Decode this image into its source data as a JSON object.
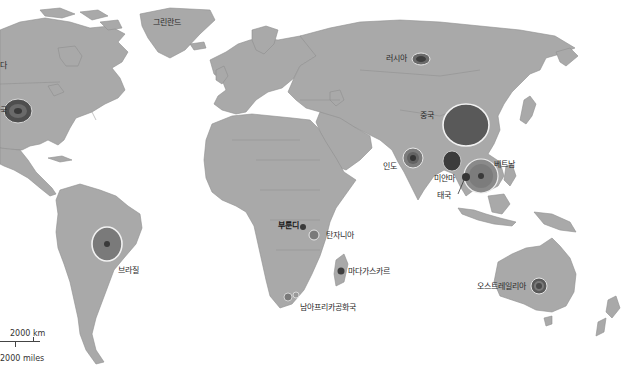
{
  "map": {
    "title": "",
    "type": "world choropleth / proportional symbol map",
    "colors": {
      "ocean": "#ffffff",
      "land": "#a9a9a9",
      "border": "#8c8c8c",
      "circle_dark": "#4a4a4a",
      "circle_mid": "#6e6e6e",
      "circle_light": "#8a8a8a",
      "circle_ring": "#f2f2f2"
    },
    "labels": {
      "canada": "캐나다",
      "usa": "미국",
      "greenland": "그린란드",
      "russia": "러시아",
      "china": "중국",
      "india": "인도",
      "myanmar": "미얀마",
      "thailand": "태국",
      "vietnam": "베트남",
      "burundi": "부룬디",
      "tanzania": "탄자니아",
      "madagascar": "마다가스카르",
      "south_africa": "남아프리카공화국",
      "brazil": "브라질",
      "australia": "오스트레일리아"
    },
    "visible_label_text": {
      "canada": "다",
      "usa": "국"
    },
    "scale": {
      "km": "2000 km",
      "miles": "2000 miles"
    },
    "symbols": [
      {
        "country": "usa",
        "cx": 18,
        "cy": 111,
        "rx": 14,
        "ry": 12,
        "fill": "#4e4e4e",
        "inner": "#6a6a6a",
        "core": "#3a3a3a"
      },
      {
        "country": "russia",
        "cx": 421,
        "cy": 59,
        "rx": 9,
        "ry": 6,
        "fill": "#6a6a6a",
        "inner": "#4c4c4c",
        "core": "#353535"
      },
      {
        "country": "china",
        "cx": 466,
        "cy": 125,
        "rx": 23,
        "ry": 21,
        "fill": "#5a5a5a",
        "inner": "",
        "core": ""
      },
      {
        "country": "india",
        "cx": 413,
        "cy": 158,
        "rx": 10,
        "ry": 10,
        "fill": "#7c7c7c",
        "inner": "#636363",
        "core": "#3a3a3a"
      },
      {
        "country": "myanmar",
        "cx": 452,
        "cy": 161,
        "rx": 9,
        "ry": 10,
        "fill": "#3c3c3c",
        "inner": "",
        "core": ""
      },
      {
        "country": "vietnam",
        "cx": 481,
        "cy": 175,
        "rx": 17,
        "ry": 17,
        "fill": "#8a8a8a",
        "inner": "#7a7a7a",
        "core": "#3c3c3c"
      },
      {
        "country": "thailand",
        "cx": 466,
        "cy": 176,
        "rx": 4,
        "ry": 4,
        "fill": "#353535",
        "inner": "",
        "core": ""
      },
      {
        "country": "brazil",
        "cx": 107,
        "cy": 244,
        "rx": 15,
        "ry": 17,
        "fill": "#7a7a7a",
        "inner": "",
        "core": "#3a3a3a"
      },
      {
        "country": "burundi",
        "cx": 303,
        "cy": 227,
        "rx": 3,
        "ry": 3,
        "fill": "#3a3a3a",
        "inner": "",
        "core": ""
      },
      {
        "country": "tanzania",
        "cx": 314,
        "cy": 235,
        "rx": 5,
        "ry": 5,
        "fill": "#7a7a7a",
        "inner": "",
        "core": ""
      },
      {
        "country": "madagascar",
        "cx": 341,
        "cy": 271,
        "rx": 3.5,
        "ry": 3.5,
        "fill": "#3e3e3e",
        "inner": "",
        "core": ""
      },
      {
        "country": "south_africa",
        "cx": 288,
        "cy": 297,
        "rx": 4,
        "ry": 4,
        "fill": "#7a7a7a",
        "inner": "",
        "core": ""
      },
      {
        "country": "south_africa_2",
        "cx": 296,
        "cy": 295,
        "rx": 3,
        "ry": 3,
        "fill": "#9a9a9a",
        "inner": "",
        "core": ""
      },
      {
        "country": "australia",
        "cx": 539,
        "cy": 286,
        "rx": 8,
        "ry": 8,
        "fill": "#5a5a5a",
        "inner": "#7a7a7a",
        "core": "#4a4a4a"
      }
    ]
  }
}
